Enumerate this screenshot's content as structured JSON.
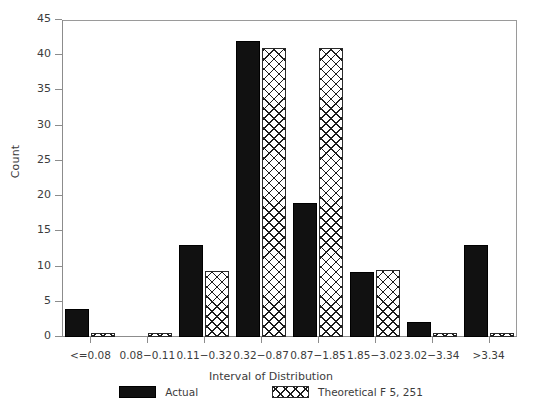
{
  "chart_data": {
    "type": "bar",
    "title": "",
    "xlabel": "Interval of Distribution",
    "ylabel": "Count",
    "categories": [
      "<=0.08",
      "0.08−0.11",
      "0.11−0.32",
      "0.32−0.87",
      "0.87−1.85",
      "1.85−3.02",
      "3.02−3.34",
      ">3.34"
    ],
    "series": [
      {
        "name": "Actual",
        "values": [
          4,
          0,
          13,
          42,
          19,
          9.2,
          2.2,
          13
        ]
      },
      {
        "name": "Theoretical F 5, 251",
        "values": [
          0.5,
          0.5,
          9.4,
          41,
          41,
          9.5,
          0.5,
          0.5
        ]
      }
    ],
    "ylim": [
      0,
      45
    ],
    "yticks": [
      0,
      5,
      10,
      15,
      20,
      25,
      30,
      35,
      40,
      45
    ],
    "grid": false,
    "legend_position": "bottom"
  },
  "legend": {
    "entries": [
      {
        "label": "Actual",
        "swatch": "solid-black-swatch"
      },
      {
        "label": "Theoretical F 5, 251",
        "swatch": "crosshatch-swatch"
      }
    ]
  },
  "caption": {
    "text": ""
  }
}
